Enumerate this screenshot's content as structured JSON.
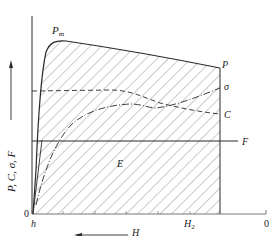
{
  "diagram": {
    "y_axis_label": "P, C, σ, F",
    "x_axis_label": "H",
    "origin_label": "0",
    "x_start_label": "h",
    "x_mark_label": "H",
    "x_mark_subscript": "2",
    "x_end_label": "0",
    "area_label": "E",
    "peak_label": "P",
    "peak_subscript": "m",
    "curves": {
      "P": {
        "label": "P",
        "style": "solid"
      },
      "sigma": {
        "label": "σ",
        "style": "dash-dot"
      },
      "C": {
        "label": "C",
        "style": "dashed"
      },
      "F": {
        "label": "F",
        "style": "solid-horizontal"
      }
    },
    "hatched_region": "area under P curve between h and H2",
    "colors": {
      "line": "#2a2a2a",
      "hatch": "#555555",
      "background": "#ffffff"
    }
  }
}
